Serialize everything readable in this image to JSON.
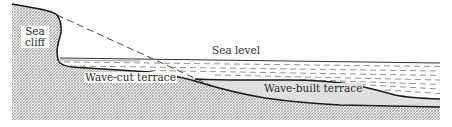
{
  "diagram": {
    "type": "coastal-profile-cross-section",
    "labels": {
      "sea_cliff_line1": "Sea",
      "sea_cliff_line2": "cliff",
      "sea_level": "Sea level",
      "wave_cut_terrace": "Wave-cut terrace",
      "wave_built_terrace": "Wave-built terrace"
    },
    "colors": {
      "bedrock_hatch": "#8a8a8a",
      "bedrock_bg": "#f2f2f2",
      "wave_built_fill": "#e0e0e0",
      "outline": "#1a1a1a",
      "water_dash": "#555555"
    }
  }
}
